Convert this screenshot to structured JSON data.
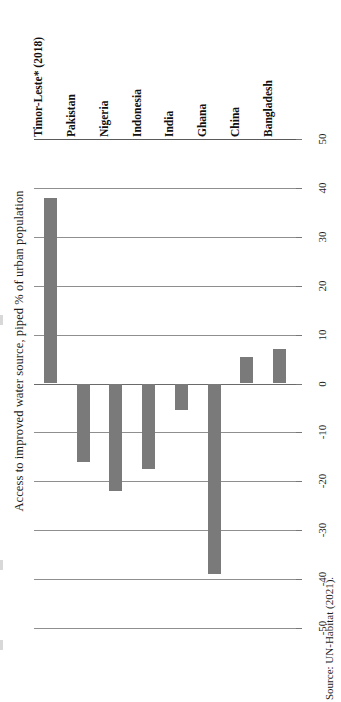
{
  "figure": {
    "axis_title": "Access to improved water source, piped % of urban population",
    "source_note": "Source: UN-Habitat (2021).",
    "bar_color": "#7a7a7a",
    "gridline_color": "#8f8f8f"
  },
  "chart_data": {
    "type": "bar",
    "title": "",
    "subtitle": "",
    "xlabel": "",
    "ylabel": "Access to improved water source, piped % of urban population",
    "orientation": "vertical-bars-on-rotated-page",
    "grid": true,
    "legend": false,
    "ylim": [
      -50,
      50
    ],
    "ytick_values": [
      50,
      40,
      30,
      20,
      10,
      0,
      -10,
      -20,
      -30,
      -40,
      -50
    ],
    "ytick_labels": [
      "50",
      "40",
      "30",
      "20",
      "10",
      "0",
      "-10",
      "-20",
      "-30",
      "-40",
      "-50"
    ],
    "categories": [
      "Timor-Leste* (2018)",
      "Pakistan",
      "Nigeria",
      "Indonesia",
      "India",
      "Ghana",
      "China",
      "Bangladesh"
    ],
    "values": [
      38,
      -16,
      -22,
      -17.5,
      -5.5,
      -39,
      5.5,
      7
    ],
    "annotations": [
      "Source: UN-Habitat (2021)."
    ]
  }
}
